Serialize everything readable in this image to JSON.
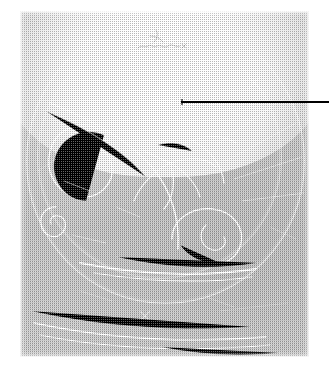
{
  "figure": {
    "kind": "bubble-chamber-photograph",
    "caption_text": "",
    "emulsion_hand_note": "",
    "plate": {
      "left_px": 20,
      "top_px": 11,
      "width_px": 289,
      "height_px": 346,
      "background_hex": "#c7c7c7",
      "track_hex": "#ffffff",
      "rendering": "halftone dither scan"
    },
    "callout": {
      "label": "",
      "color_hex": "#000000",
      "start_x_px": 181,
      "start_y_px": 102,
      "end_x_px": 329,
      "end_y_px": 102,
      "thickness_px": 2
    },
    "features": [
      {
        "name": "bright-dome-arc",
        "x_px": 150,
        "y_px": 45
      },
      {
        "name": "large-spiral-upper-left",
        "x_px": 65,
        "y_px": 133
      },
      {
        "name": "interaction-vertex-center",
        "x_px": 150,
        "y_px": 160
      },
      {
        "name": "small-spiral-left",
        "x_px": 43,
        "y_px": 216
      },
      {
        "name": "loop-lower-right",
        "x_px": 196,
        "y_px": 242
      },
      {
        "name": "long-horizontal-track",
        "x_px": 155,
        "y_px": 272
      },
      {
        "name": "beam-track-bundle-bottom",
        "x_px": 160,
        "y_px": 330
      }
    ]
  }
}
